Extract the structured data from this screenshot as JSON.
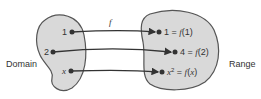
{
  "diagram": {
    "domain_label": "Domain",
    "range_label": "Range",
    "function_label": "f",
    "domain_points": [
      "1",
      "2",
      "x"
    ],
    "range_points": [
      {
        "value": "1",
        "expr": "f(1)"
      },
      {
        "value": "4",
        "expr": "f(2)"
      },
      {
        "value": "x²",
        "expr": "f(x)"
      }
    ],
    "colors": {
      "blob_fill": "#d9d9d9",
      "blob_stroke": "#555555",
      "arrow": "#333333"
    }
  }
}
